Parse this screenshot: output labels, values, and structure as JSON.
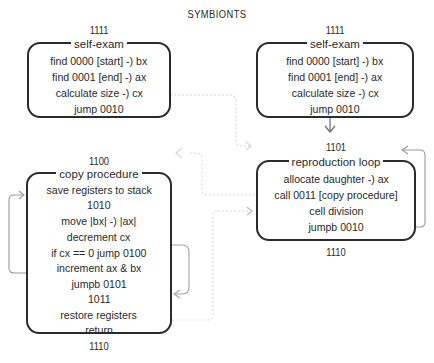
{
  "title": "SYMBIONTS",
  "left_column": {
    "self_exam": {
      "address": "1111",
      "title": "self-exam",
      "lines": [
        "find 0000 [start] -) bx",
        "find 0001  [end]  -) ax",
        "calculate size      -) cx",
        "jump 0010"
      ]
    },
    "copy_procedure": {
      "address": "1100",
      "title": "copy procedure",
      "lines": [
        "save registers to stack",
        "1010",
        "move |bx| -) |ax|",
        "decrement cx",
        "if cx == 0 jump 0100",
        "increment ax & bx",
        "jumpb 0101",
        "1011",
        "restore registers",
        "return"
      ],
      "end_address": "1110"
    }
  },
  "right_column": {
    "self_exam": {
      "address": "1111",
      "title": "self-exam",
      "lines": [
        "find 0000 [start] -) bx",
        "find 0001  [end]  -) ax",
        "calculate size      -) cx",
        "jump 0010"
      ]
    },
    "reproduction_loop": {
      "address": "1101",
      "title": "reproduction loop",
      "lines": [
        "allocate daughter -) ax",
        "call 0011 [copy procedure]",
        "cell division",
        "jumpb 0010"
      ],
      "end_address": "1110"
    }
  },
  "colors": {
    "box_border": "#2b2b2b",
    "connector_solid": "#9a9a9a",
    "connector_dotted": "#d8d8d8"
  }
}
